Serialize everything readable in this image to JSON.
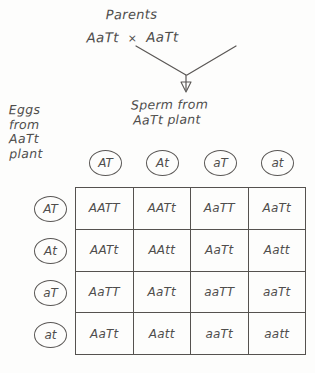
{
  "diagram": {
    "title": "Parents",
    "parents": {
      "mother_genotype": "AaTt",
      "cross_symbol": "×",
      "father_genotype": "AaTt"
    },
    "sperm_label_line1": "Sperm from",
    "sperm_label_line2": "AaTt plant",
    "eggs_label_line1": "Eggs",
    "eggs_label_line2": "from",
    "eggs_label_line3": "AaTt",
    "eggs_label_line4": "plant",
    "ink_color": "#4f4d4c",
    "background_color": "#fdfdfc"
  },
  "column_gametes": [
    "AT",
    "At",
    "aT",
    "at"
  ],
  "row_gametes": [
    "AT",
    "At",
    "aT",
    "at"
  ],
  "grid": {
    "rows": [
      [
        "AATT",
        "AATt",
        "AaTT",
        "AaTt"
      ],
      [
        "AATt",
        "AAtt",
        "AaTt",
        "Aatt"
      ],
      [
        "AaTT",
        "AaTt",
        "aaTT",
        "aaTt"
      ],
      [
        "AaTt",
        "Aatt",
        "aaTt",
        "aatt"
      ]
    ]
  }
}
